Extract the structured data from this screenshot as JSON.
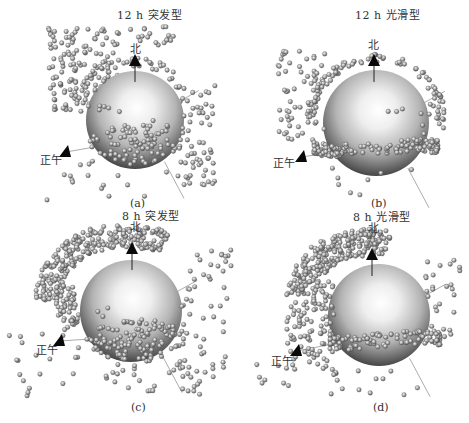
{
  "figure": {
    "panels": [
      {
        "id": "a",
        "title": "12 h 突发型",
        "caption": "(a)",
        "north_label": "北",
        "noon_label": "正午",
        "title_pos": [
          117,
          10
        ],
        "caption_pos": [
          130,
          198
        ],
        "north_pos": [
          130,
          44
        ],
        "noon_pos": [
          40,
          155
        ],
        "sphere": {
          "cx": 135,
          "cy": 120,
          "r": 49
        },
        "north_marker": [
          135,
          60
        ],
        "noon_marker": [
          66,
          152
        ],
        "clusters": [
          {
            "type": "box",
            "x0": 48,
            "y0": 28,
            "x1": 120,
            "y1": 112,
            "n": 150,
            "seed": 11
          },
          {
            "type": "box",
            "x0": 130,
            "y0": 25,
            "x1": 175,
            "y1": 45,
            "n": 18,
            "seed": 12
          },
          {
            "type": "arc",
            "cx": 135,
            "cy": 120,
            "rx": 56,
            "ry": 58,
            "a0": 200,
            "a1": 340,
            "spread": 5,
            "n": 40,
            "seed": 13
          },
          {
            "type": "box",
            "x0": 180,
            "y0": 85,
            "x1": 215,
            "y1": 185,
            "n": 55,
            "seed": 14
          },
          {
            "type": "disc",
            "cx": 135,
            "cy": 145,
            "rx": 46,
            "ry": 20,
            "n": 85,
            "seed": 15
          },
          {
            "type": "disc",
            "cx": 135,
            "cy": 110,
            "rx": 40,
            "ry": 40,
            "n": 10,
            "seed": 16
          },
          {
            "type": "box",
            "x0": 40,
            "y0": 160,
            "x1": 215,
            "y1": 200,
            "n": 22,
            "seed": 17
          }
        ]
      },
      {
        "id": "b",
        "title": "12 h 光滑型",
        "caption": "(b)",
        "north_label": "北",
        "noon_label": "正午",
        "title_pos": [
          355,
          10
        ],
        "caption_pos": [
          371,
          198
        ],
        "north_pos": [
          368,
          40
        ],
        "noon_pos": [
          273,
          158
        ],
        "sphere": {
          "cx": 376,
          "cy": 123,
          "r": 53
        },
        "north_marker": [
          374,
          60
        ],
        "noon_marker": [
          302,
          157
        ],
        "clusters": [
          {
            "type": "arc",
            "cx": 376,
            "cy": 120,
            "rx": 66,
            "ry": 62,
            "a0": 180,
            "a1": 360,
            "spread": 4,
            "n": 90,
            "seed": 21
          },
          {
            "type": "box",
            "x0": 278,
            "y0": 50,
            "x1": 325,
            "y1": 140,
            "n": 60,
            "seed": 22
          },
          {
            "type": "band",
            "cx": 376,
            "cy": 148,
            "rx": 62,
            "ry": 14,
            "n": 150,
            "seed": 23
          },
          {
            "type": "box",
            "x0": 420,
            "y0": 95,
            "x1": 445,
            "y1": 140,
            "n": 14,
            "seed": 24
          },
          {
            "type": "disc",
            "cx": 370,
            "cy": 100,
            "rx": 35,
            "ry": 25,
            "n": 10,
            "seed": 25
          },
          {
            "type": "box",
            "x0": 330,
            "y0": 165,
            "x1": 445,
            "y1": 200,
            "n": 8,
            "seed": 26
          }
        ]
      },
      {
        "id": "c",
        "title": "8 h 突发型",
        "caption": "(c)",
        "north_label": "北",
        "noon_label": "正午",
        "title_pos": [
          122,
          211
        ],
        "caption_pos": [
          131,
          402
        ],
        "north_pos": [
          130,
          222
        ],
        "noon_pos": [
          36,
          345
        ],
        "sphere": {
          "cx": 131,
          "cy": 311,
          "r": 51
        },
        "north_marker": [
          132,
          248
        ],
        "noon_marker": [
          60,
          341
        ],
        "clusters": [
          {
            "type": "arc",
            "cx": 125,
            "cy": 300,
            "rx": 78,
            "ry": 65,
            "a0": 180,
            "a1": 300,
            "spread": 12,
            "n": 260,
            "seed": 31
          },
          {
            "type": "arc",
            "cx": 125,
            "cy": 300,
            "rx": 60,
            "ry": 50,
            "a0": 150,
            "a1": 200,
            "spread": 10,
            "n": 60,
            "seed": 32
          },
          {
            "type": "disc",
            "cx": 135,
            "cy": 340,
            "rx": 50,
            "ry": 22,
            "n": 130,
            "seed": 33
          },
          {
            "type": "box",
            "x0": 180,
            "y0": 250,
            "x1": 232,
            "y1": 390,
            "n": 55,
            "seed": 34
          },
          {
            "type": "box",
            "x0": 8,
            "y0": 330,
            "x1": 80,
            "y1": 400,
            "n": 20,
            "seed": 35
          },
          {
            "type": "box",
            "x0": 100,
            "y0": 360,
            "x1": 200,
            "y1": 395,
            "n": 30,
            "seed": 36
          },
          {
            "type": "disc",
            "cx": 130,
            "cy": 295,
            "rx": 40,
            "ry": 30,
            "n": 12,
            "seed": 37
          }
        ]
      },
      {
        "id": "d",
        "title": "8 h 光滑型",
        "caption": "(d)",
        "north_label": "北",
        "noon_label": "正午",
        "title_pos": [
          353,
          212
        ],
        "caption_pos": [
          373,
          402
        ],
        "north_pos": [
          368,
          223
        ],
        "noon_pos": [
          271,
          356
        ],
        "sphere": {
          "cx": 379,
          "cy": 315,
          "r": 51
        },
        "north_marker": [
          372,
          254
        ],
        "noon_marker": [
          297,
          351
        ],
        "clusters": [
          {
            "type": "arc",
            "cx": 365,
            "cy": 300,
            "rx": 65,
            "ry": 58,
            "a0": 185,
            "a1": 290,
            "spread": 14,
            "n": 250,
            "seed": 41
          },
          {
            "type": "box",
            "x0": 285,
            "y0": 280,
            "x1": 335,
            "y1": 370,
            "n": 110,
            "seed": 42
          },
          {
            "type": "band",
            "cx": 385,
            "cy": 340,
            "rx": 55,
            "ry": 14,
            "n": 110,
            "seed": 43
          },
          {
            "type": "box",
            "x0": 420,
            "y0": 260,
            "x1": 460,
            "y1": 340,
            "n": 30,
            "seed": 44
          },
          {
            "type": "box",
            "x0": 240,
            "y0": 360,
            "x1": 300,
            "y1": 410,
            "n": 8,
            "seed": 45
          },
          {
            "type": "box",
            "x0": 320,
            "y0": 370,
            "x1": 420,
            "y1": 395,
            "n": 14,
            "seed": 46
          }
        ]
      }
    ]
  }
}
